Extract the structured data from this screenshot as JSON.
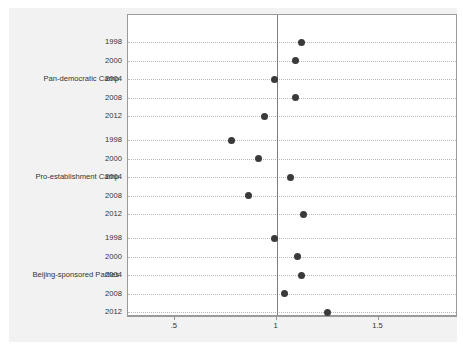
{
  "chart_data": {
    "type": "scatter",
    "title": "",
    "subtitle": "",
    "xlabel": "",
    "ylabel": "",
    "xlim": [
      0.27,
      1.89
    ],
    "xticks": [
      0.5,
      1,
      1.5
    ],
    "xtick_labels": [
      ".5",
      "1",
      "1.5"
    ],
    "grid": true,
    "grid_style": "dotted horizontal",
    "legend": "none",
    "reference_line": {
      "x": 1,
      "orientation": "vertical",
      "color": "#808080"
    },
    "marker_color": "#3a3a3a",
    "panel_background": "#ffffff",
    "figure_background": "#f2f2f2",
    "groups": [
      {
        "label": "Pan-democratic Camp",
        "categories": [
          "1998",
          "2000",
          "2004",
          "2008",
          "2012"
        ],
        "values": [
          1.12,
          1.09,
          0.99,
          1.09,
          0.94
        ]
      },
      {
        "label": "Pro-establishment Camp",
        "categories": [
          "1998",
          "2000",
          "2004",
          "2008",
          "2012"
        ],
        "values": [
          0.78,
          0.91,
          1.07,
          0.86,
          1.13
        ]
      },
      {
        "label": "Beijing-sponsored Parties",
        "categories": [
          "1998",
          "2000",
          "2004",
          "2008",
          "2012"
        ],
        "values": [
          0.99,
          1.1,
          1.12,
          1.04,
          1.25
        ]
      }
    ]
  }
}
